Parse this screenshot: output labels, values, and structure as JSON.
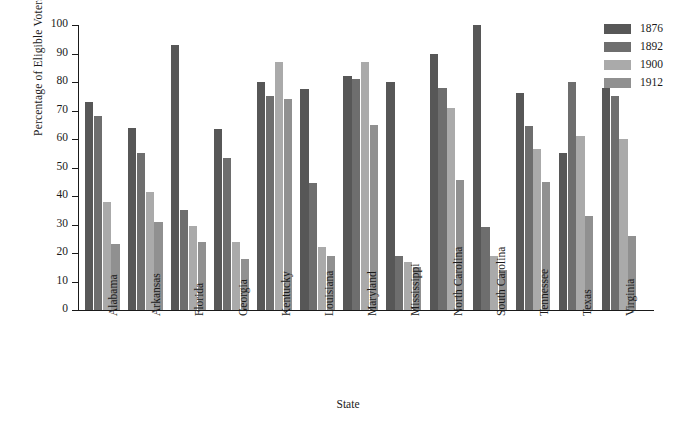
{
  "chart_data": {
    "type": "bar",
    "title": "",
    "xlabel": "State",
    "ylabel": "Percentage of Eligible Voters",
    "ylim": [
      0,
      100
    ],
    "yticks": [
      0,
      10,
      20,
      30,
      40,
      50,
      60,
      70,
      80,
      90,
      100
    ],
    "grid": false,
    "legend_position": "top-right",
    "categories": [
      "Alabama",
      "Arkansas",
      "Florida",
      "Georgia",
      "Kentucky",
      "Louisiana",
      "Maryland",
      "Mississippi",
      "North Carolina",
      "South Carolina",
      "Tennessee",
      "Texas",
      "Virginia"
    ],
    "series": [
      {
        "name": "1876",
        "color": "#575757",
        "values": [
          73,
          64,
          93,
          63.5,
          80,
          77.5,
          82,
          80,
          90,
          100,
          76,
          55,
          78
        ]
      },
      {
        "name": "1892",
        "color": "#6e6e6e",
        "values": [
          68,
          55,
          35,
          53.5,
          75,
          44.5,
          81,
          19,
          78,
          29,
          64.5,
          80,
          75
        ]
      },
      {
        "name": "1900",
        "color": "#aaaaaa",
        "values": [
          38,
          41.5,
          29.5,
          24,
          87,
          22,
          87,
          17,
          71,
          19,
          56.5,
          61,
          60
        ]
      },
      {
        "name": "1912",
        "color": "#909090",
        "values": [
          23,
          31,
          24,
          18,
          74,
          19,
          65,
          15,
          45.5,
          14,
          45,
          33,
          26
        ]
      }
    ]
  }
}
